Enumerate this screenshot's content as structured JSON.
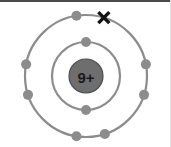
{
  "diagram": {
    "type": "bohr-atomic-model",
    "background_color": "#ffffff",
    "orbit_color": "#8c8c8c",
    "electron_color": "#8c8c8c",
    "nucleus_fill_color": "#6e6e6e",
    "nucleus_stroke_color": "#4e4e4e",
    "x_mark_color": "#141414",
    "top_border_color": "#4a4a4a",
    "right_border_color": "#e2e2e2",
    "center": {
      "x": 86,
      "y": 76
    },
    "nucleus": {
      "label": "9+",
      "charge_number": 9,
      "charge_sign": "+",
      "radius": 17
    },
    "shells": [
      {
        "name": "inner-shell",
        "shell_index": 1,
        "radius": 34,
        "electron_count": 2,
        "electrons": [
          {
            "name": "electron-inner-top",
            "angle_deg": -90
          },
          {
            "name": "electron-inner-bottom",
            "angle_deg": 90
          }
        ]
      },
      {
        "name": "outer-shell",
        "shell_index": 2,
        "radius": 61,
        "electron_count": 7,
        "electrons": [
          {
            "name": "electron-outer-top",
            "angle_deg": -99
          },
          {
            "name": "electron-outer-left-upper",
            "angle_deg": 191
          },
          {
            "name": "electron-outer-left-lower",
            "angle_deg": 162
          },
          {
            "name": "electron-outer-right-upper",
            "angle_deg": -11
          },
          {
            "name": "electron-outer-right-lower",
            "angle_deg": 18
          },
          {
            "name": "electron-outer-bottom-left",
            "angle_deg": 99
          },
          {
            "name": "electron-outer-bottom-right",
            "angle_deg": 72
          }
        ]
      }
    ],
    "x_mark": {
      "name": "x-mark-electron",
      "label": "X",
      "shell": "outer-shell",
      "angle_deg": -73,
      "size": 11
    },
    "electron_radius": 5,
    "totals": {
      "total_electrons_drawn": 9,
      "outer_dots": 7,
      "outer_x_marks": 1,
      "inner_dots": 2
    }
  }
}
